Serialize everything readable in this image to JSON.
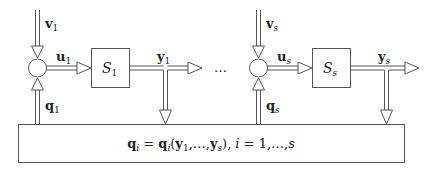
{
  "diagram": {
    "colors": {
      "stroke": "#555555",
      "text": "#222222",
      "background": "#ffffff"
    },
    "subsystems": [
      {
        "id": "1",
        "input_v": {
          "base": "v",
          "sub": "1"
        },
        "input_u": {
          "base": "u",
          "sub": "1"
        },
        "feedback_q": {
          "base": "q",
          "sub": "1"
        },
        "block": {
          "base": "S",
          "sub": "1"
        },
        "output_y": {
          "base": "y",
          "sub": "1"
        }
      },
      {
        "id": "s",
        "input_v": {
          "base": "v",
          "sub": "s"
        },
        "input_u": {
          "base": "u",
          "sub": "s"
        },
        "feedback_q": {
          "base": "q",
          "sub": "s"
        },
        "block": {
          "base": "S",
          "sub": "s"
        },
        "output_y": {
          "base": "y",
          "sub": "s"
        }
      }
    ],
    "ellipsis": "…",
    "interconnection": {
      "lhs_base": "q",
      "lhs_sub": "i",
      "eq": " = ",
      "rhs_base": "q",
      "rhs_sub": "i",
      "args_open": "(",
      "arg1_base": "y",
      "arg1_sub": "1",
      "args_mid": ",…,",
      "arg2_base": "y",
      "arg2_sub": "s",
      "args_close": "),",
      "index_var": "i",
      "index_range": " = 1,…,",
      "index_end": "s"
    }
  }
}
